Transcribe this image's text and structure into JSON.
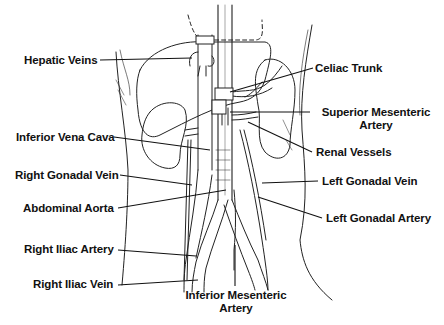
{
  "diagram": {
    "colors": {
      "ink": "#111111",
      "background": "#ffffff"
    },
    "labels_left": [
      {
        "id": "hepatic-veins",
        "text": "Hepatic Veins"
      },
      {
        "id": "inferior-vena-cava",
        "text": "Inferior Vena Cava"
      },
      {
        "id": "right-gonadal-vein",
        "text": "Right Gonadal Vein"
      },
      {
        "id": "abdominal-aorta",
        "text": "Abdominal Aorta"
      },
      {
        "id": "right-iliac-artery",
        "text": "Right Iliac Artery"
      },
      {
        "id": "right-iliac-vein",
        "text": "Right Iliac Vein"
      }
    ],
    "labels_right": [
      {
        "id": "celiac-trunk",
        "text": "Celiac Trunk"
      },
      {
        "id": "superior-mesenteric-artery",
        "line1": "Superior Mesenteric",
        "line2": "Artery"
      },
      {
        "id": "renal-vessels",
        "text": "Renal Vessels"
      },
      {
        "id": "left-gonadal-vein",
        "text": "Left Gonadal Vein"
      },
      {
        "id": "left-gonadal-artery",
        "text": "Left Gonadal Artery"
      }
    ],
    "labels_bottom": [
      {
        "id": "inferior-mesenteric-artery",
        "line1": "Inferior Mesenteric",
        "line2": "Artery"
      }
    ]
  }
}
